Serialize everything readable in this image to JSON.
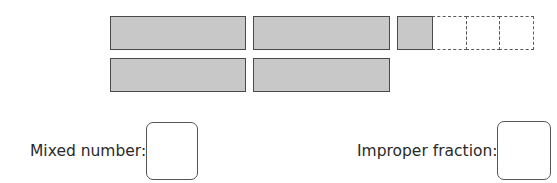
{
  "diagram": {
    "whole_bars": 4,
    "partial_bar": {
      "shaded_parts": 1,
      "total_parts": 4
    },
    "shade_color": "#c8c8c8",
    "border_color": "#4a4a4a"
  },
  "questions": {
    "mixed_number": {
      "label": "Mixed number:",
      "value": ""
    },
    "improper_fraction": {
      "label": "Improper fraction:",
      "value": ""
    }
  }
}
